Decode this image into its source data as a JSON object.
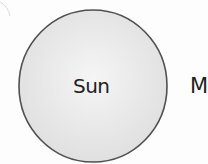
{
  "diagram": {
    "bodies": [
      {
        "id": "sun",
        "label": "Sun",
        "shape": "circle",
        "center": [
          93,
          86
        ],
        "radius": 75,
        "fill": "#ececec",
        "stroke": "#555555"
      },
      {
        "id": "partial-body",
        "label": "M",
        "note": "label cut off at right edge"
      }
    ],
    "colors": {
      "background": "#fdfdfd",
      "circle_fill_center": "#f4f4f4",
      "circle_fill_edge": "#e2e2e2",
      "circle_stroke": "#555555",
      "text": "#222222"
    }
  }
}
